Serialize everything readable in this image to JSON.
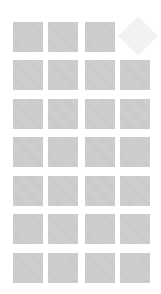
{
  "grid": {
    "columns": 4,
    "rows": 7,
    "tile_color": "#cecece",
    "placeholder_color": "#f2f2f2",
    "col_x": [
      13,
      48,
      85,
      120
    ],
    "row_y": [
      22,
      60,
      99,
      137,
      176,
      214,
      253
    ],
    "tiles": [
      {
        "row": 0,
        "col": 0,
        "icon": "image-placeholder-tile"
      },
      {
        "row": 0,
        "col": 1,
        "icon": "image-placeholder-tile"
      },
      {
        "row": 0,
        "col": 2,
        "icon": "image-placeholder-tile"
      },
      {
        "row": 0,
        "col": 3,
        "icon": "diamond-placeholder"
      },
      {
        "row": 1,
        "col": 0
      },
      {
        "row": 1,
        "col": 1
      },
      {
        "row": 1,
        "col": 2
      },
      {
        "row": 1,
        "col": 3
      },
      {
        "row": 2,
        "col": 0
      },
      {
        "row": 2,
        "col": 1
      },
      {
        "row": 2,
        "col": 2
      },
      {
        "row": 2,
        "col": 3
      },
      {
        "row": 3,
        "col": 0
      },
      {
        "row": 3,
        "col": 1
      },
      {
        "row": 3,
        "col": 2
      },
      {
        "row": 3,
        "col": 3
      },
      {
        "row": 4,
        "col": 0
      },
      {
        "row": 4,
        "col": 1
      },
      {
        "row": 4,
        "col": 2
      },
      {
        "row": 4,
        "col": 3
      },
      {
        "row": 5,
        "col": 0
      },
      {
        "row": 5,
        "col": 1
      },
      {
        "row": 5,
        "col": 2
      },
      {
        "row": 5,
        "col": 3
      },
      {
        "row": 6,
        "col": 0
      },
      {
        "row": 6,
        "col": 1
      },
      {
        "row": 6,
        "col": 2
      },
      {
        "row": 6,
        "col": 3
      }
    ]
  }
}
